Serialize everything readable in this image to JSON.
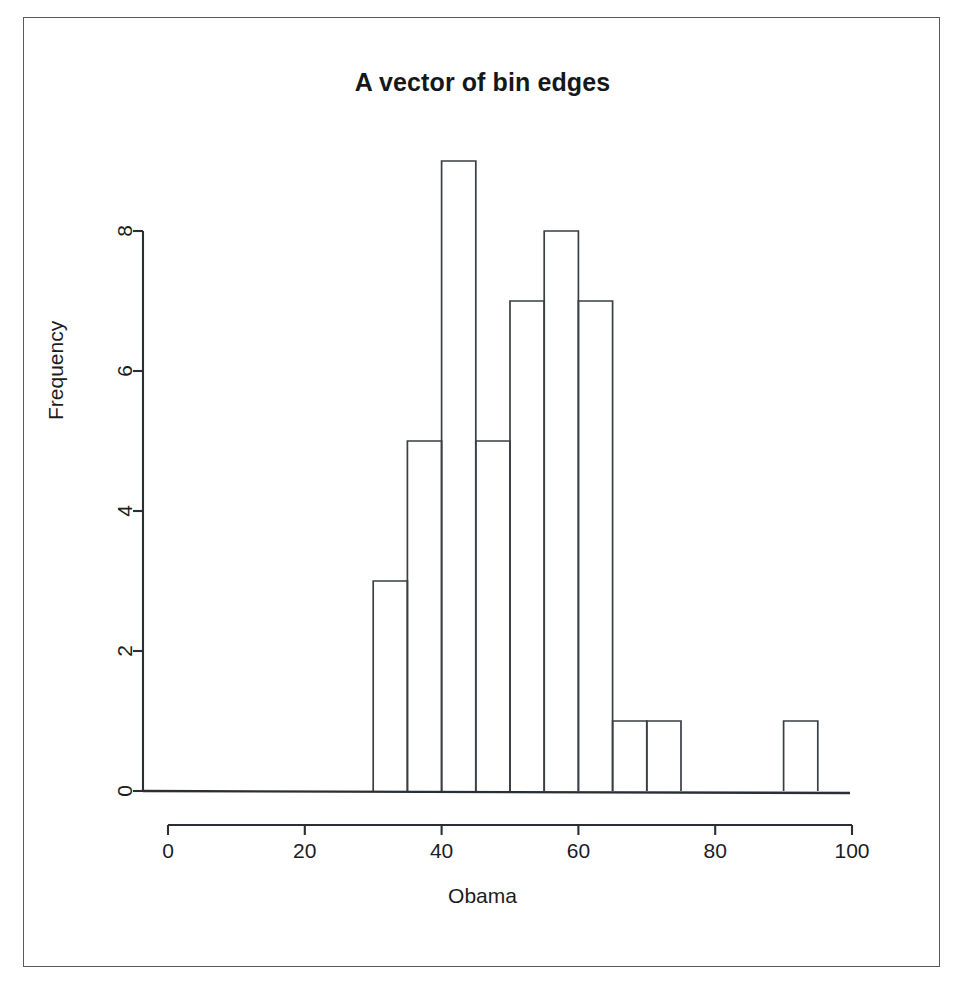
{
  "figure": {
    "title": "A vector of bin edges",
    "xlabel": "Obama",
    "ylabel": "Frequency",
    "caption_bleed": ""
  },
  "colors": {
    "axis": "#2a2f33",
    "bar_stroke": "#3a3f43",
    "bar_fill": "none",
    "text": "#1a1d1f",
    "frame": "#555b5e",
    "background": "#ffffff"
  },
  "chart_data": {
    "type": "bar",
    "title": "A vector of bin edges",
    "xlabel": "Obama",
    "ylabel": "Frequency",
    "xlim": [
      0,
      100
    ],
    "ylim": [
      0,
      9
    ],
    "grid": false,
    "legend": null,
    "bin_width": 5,
    "bin_edges": [
      30,
      35,
      40,
      45,
      50,
      55,
      60,
      65,
      70,
      75,
      80,
      85,
      90,
      95
    ],
    "categories": [
      "30-35",
      "35-40",
      "40-45",
      "45-50",
      "50-55",
      "55-60",
      "60-65",
      "65-70",
      "70-75",
      "75-80",
      "80-85",
      "85-90",
      "90-95"
    ],
    "values": [
      3,
      5,
      9,
      5,
      7,
      8,
      7,
      1,
      1,
      0,
      0,
      0,
      1
    ],
    "bars": [
      {
        "x0": 30,
        "x1": 35,
        "count": 3
      },
      {
        "x0": 35,
        "x1": 40,
        "count": 5
      },
      {
        "x0": 40,
        "x1": 45,
        "count": 9
      },
      {
        "x0": 45,
        "x1": 50,
        "count": 5
      },
      {
        "x0": 50,
        "x1": 55,
        "count": 7
      },
      {
        "x0": 55,
        "x1": 60,
        "count": 8
      },
      {
        "x0": 60,
        "x1": 65,
        "count": 7
      },
      {
        "x0": 65,
        "x1": 70,
        "count": 1
      },
      {
        "x0": 70,
        "x1": 75,
        "count": 1
      },
      {
        "x0": 90,
        "x1": 95,
        "count": 1
      }
    ],
    "xticks": [
      0,
      20,
      40,
      60,
      80,
      100
    ],
    "xtick_labels": [
      "0",
      "20",
      "40",
      "60",
      "80",
      "100"
    ],
    "yticks": [
      0,
      2,
      4,
      6,
      8
    ],
    "ytick_labels": [
      "0",
      "2",
      "4",
      "6",
      "8"
    ]
  },
  "geometry": {
    "x_px_at_0": 168,
    "x_px_at_100": 852,
    "y_px_at_0": 791,
    "y_px_per_unit": 70,
    "x_axis_line_y": 825,
    "y_axis_line_x": 143,
    "tick_len": 10
  }
}
